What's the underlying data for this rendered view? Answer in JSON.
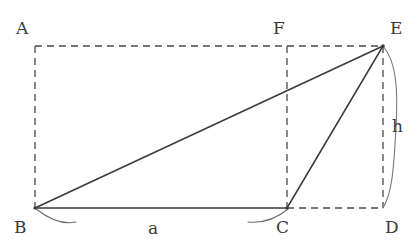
{
  "figure": {
    "background_color": "#ffffff",
    "stroke_color": "#3a3a3a",
    "dashed_color": "#4a4a4a",
    "labels": {
      "a_vertex": "A",
      "b_vertex": "B",
      "c_vertex": "C",
      "d_vertex": "D",
      "e_vertex": "E",
      "f_vertex": "F",
      "base_length": "a",
      "height": "h"
    },
    "geometry": {
      "points": {
        "A": {
          "x": 35,
          "y": 46
        },
        "B": {
          "x": 35,
          "y": 208
        },
        "C": {
          "x": 287,
          "y": 208
        },
        "D": {
          "x": 383,
          "y": 208
        },
        "E": {
          "x": 383,
          "y": 46
        },
        "F": {
          "x": 287,
          "y": 46
        }
      },
      "solid_segments": [
        {
          "name": "BE",
          "from": "B",
          "to": "E"
        },
        {
          "name": "BC",
          "from": "B",
          "to": "C"
        },
        {
          "name": "CE",
          "from": "C",
          "to": "E"
        }
      ],
      "dashed_segments": [
        {
          "name": "AE",
          "from": "A",
          "to": "E"
        },
        {
          "name": "AB",
          "from": "A",
          "to": "B"
        },
        {
          "name": "CD",
          "from": "C",
          "to": "D"
        },
        {
          "name": "ED",
          "from": "E",
          "to": "D"
        },
        {
          "name": "FC",
          "from": "F",
          "to": "C"
        }
      ],
      "angle_arcs": [
        {
          "name": "angle-at-B",
          "vertex": "B"
        },
        {
          "name": "angle-at-C",
          "vertex": "C"
        }
      ],
      "brace": {
        "name": "height-brace",
        "from": "E",
        "to": "D"
      }
    },
    "label_positions": {
      "A": {
        "x": 16,
        "y": 20
      },
      "F": {
        "x": 273,
        "y": 20
      },
      "E": {
        "x": 390,
        "y": 20
      },
      "B": {
        "x": 14,
        "y": 219
      },
      "a": {
        "x": 148,
        "y": 220
      },
      "C": {
        "x": 276,
        "y": 219
      },
      "D": {
        "x": 385,
        "y": 219
      },
      "h": {
        "x": 392,
        "y": 118
      }
    }
  }
}
